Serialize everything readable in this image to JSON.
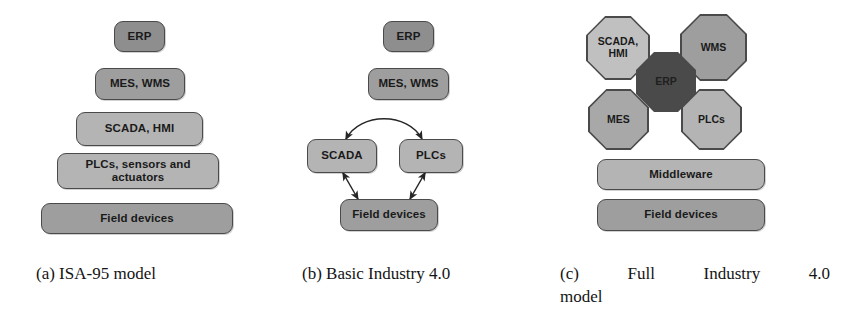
{
  "figure": {
    "kind": "three-panel architecture diagram",
    "panels": [
      {
        "id": "a",
        "caption_prefix": "(a)",
        "caption_text": "ISA-95 model",
        "caption_full": "(a) ISA-95 model",
        "layout": "pyramid",
        "layers": [
          {
            "label": "ERP",
            "tone": "#8e8e8e"
          },
          {
            "label": "MES, WMS",
            "tone": "#9e9e9e"
          },
          {
            "label": "SCADA, HMI",
            "tone": "#b4b4b4"
          },
          {
            "label": "PLCs, sensors and actuators",
            "line1": "PLCs, sensors and",
            "line2": "actuators",
            "tone": "#b4b4b4"
          },
          {
            "label": "Field devices",
            "tone": "#9e9e9e"
          }
        ]
      },
      {
        "id": "b",
        "caption_prefix": "(b)",
        "caption_text": "Basic Industry 4.0",
        "caption_full": "(b) Basic Industry 4.0",
        "layout": "network",
        "nodes": [
          {
            "label": "ERP",
            "tone": "#8e8e8e"
          },
          {
            "label": "MES, WMS",
            "tone": "#9e9e9e"
          },
          {
            "label": "SCADA",
            "tone": "#b4b4b4"
          },
          {
            "label": "PLCs",
            "tone": "#b4b4b4"
          },
          {
            "label": "Field devices",
            "tone": "#9e9e9e"
          }
        ],
        "connections": [
          {
            "from": "SCADA",
            "to": "PLCs",
            "style": "curved-double-arrow"
          },
          {
            "from": "SCADA",
            "to": "Field devices",
            "style": "double-arrow"
          },
          {
            "from": "PLCs",
            "to": "Field devices",
            "style": "double-arrow"
          }
        ]
      },
      {
        "id": "c",
        "caption_prefix": "(c)",
        "caption_words_line1": [
          "Full",
          "Industry",
          "4.0"
        ],
        "caption_line2": "model",
        "caption_full": "(c) Full Industry 4.0 model",
        "layout": "octagon-cluster-over-bars",
        "octagons": [
          {
            "label": "SCADA, HMI",
            "line1": "SCADA,",
            "line2": "HMI",
            "tone": "#c0c0c0"
          },
          {
            "label": "WMS",
            "tone": "#9e9e9e"
          },
          {
            "label": "ERP",
            "tone": "#4a4a4a"
          },
          {
            "label": "MES",
            "tone": "#a8a8a8"
          },
          {
            "label": "PLCs",
            "tone": "#b4b4b4"
          }
        ],
        "bars": [
          {
            "label": "Middleware",
            "tone": "#b4b4b4"
          },
          {
            "label": "Field devices",
            "tone": "#9e9e9e"
          }
        ]
      }
    ],
    "colors": {
      "background": "#ffffff",
      "stroke": "#4a4a4a",
      "text": "#1a1a1a",
      "tone_dark": "#8e8e8e",
      "tone_mid": "#9e9e9e",
      "tone_light": "#b4b4b4",
      "tone_lighter": "#c0c0c0",
      "tone_erp": "#4a4a4a"
    }
  }
}
